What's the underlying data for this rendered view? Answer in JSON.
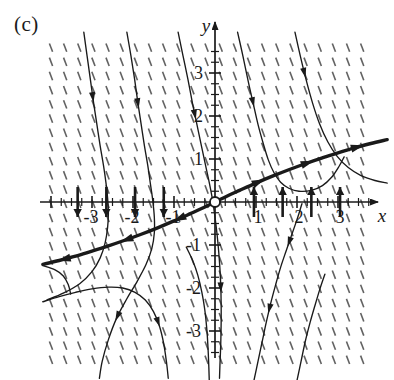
{
  "figure": {
    "panel_label": "(c)",
    "type": "direction-field-with-solution-curves",
    "background_color": "#ffffff",
    "ink_color": "#1a1a1a",
    "field_tick_color": "#555555"
  },
  "axes": {
    "x_axis_label": "x",
    "y_axis_label": "y",
    "origin_px": {
      "x": 215,
      "y": 202
    },
    "unit_px": {
      "x": 41,
      "y": 43
    },
    "x_tick_labels": [
      "-3",
      "-2",
      "-1",
      "1",
      "2",
      "3"
    ],
    "x_tick_values": [
      -3,
      -2,
      -1,
      1,
      2,
      3
    ],
    "y_tick_labels": [
      "3",
      "2",
      "1",
      "-1",
      "-2",
      "-3"
    ],
    "y_tick_values": [
      3,
      2,
      1,
      -1,
      -2,
      -3
    ],
    "xlim": [
      -4.2,
      4.0
    ],
    "ylim": [
      -4.2,
      3.9
    ],
    "minor_ticks_per_unit": 3,
    "axis_arrow_ends": [
      "x-positive",
      "y-positive"
    ],
    "equilibrium_marker": {
      "shape": "open-circle",
      "x": 0,
      "y": 0
    }
  },
  "chart_data": {
    "type": "line",
    "title": "",
    "subtitle": "",
    "xlabel": "x",
    "ylabel": "y",
    "xlim": [
      -4.2,
      4.0
    ],
    "ylim": [
      -4.2,
      3.9
    ],
    "grid": false,
    "legend": "none",
    "annotations": [
      "(c)"
    ],
    "x_ticks": [
      -3,
      -2,
      -1,
      1,
      2,
      3
    ],
    "y_ticks": [
      -3,
      -2,
      -1,
      1,
      2,
      3
    ],
    "direction_field": {
      "description": "short line segments of steep negative slope on a regular lattice",
      "x_start": -4.0,
      "x_end": 3.9,
      "y_start": -4.0,
      "y_end": 3.6,
      "x_step": 0.345,
      "y_step": 0.33,
      "segment_length_px": 9,
      "segment_slope_px": {
        "dx": -3.2,
        "dy": -8.4
      }
    },
    "axis_flow_arrows": {
      "description": "bold vertical arrows on the x-axis showing flow direction",
      "negative_side_direction": "down",
      "positive_side_direction": "up",
      "x_positions": [
        -3.35,
        -2.65,
        -1.95,
        -1.25,
        0.95,
        1.65,
        2.35,
        3.05
      ],
      "length_px": 30
    },
    "separatrix": {
      "name": "bold separatrix through origin",
      "style": "bold",
      "points": [
        [
          -4.2,
          -1.45
        ],
        [
          -3.8,
          -1.36
        ],
        [
          -3.4,
          -1.26
        ],
        [
          -3.0,
          -1.14
        ],
        [
          -2.6,
          -1.02
        ],
        [
          -2.2,
          -0.89
        ],
        [
          -1.8,
          -0.75
        ],
        [
          -1.4,
          -0.6
        ],
        [
          -1.0,
          -0.44
        ],
        [
          -0.6,
          -0.27
        ],
        [
          -0.3,
          -0.14
        ],
        [
          0.0,
          0.0
        ],
        [
          0.3,
          0.14
        ],
        [
          0.6,
          0.27
        ],
        [
          1.0,
          0.44
        ],
        [
          1.4,
          0.6
        ],
        [
          1.8,
          0.75
        ],
        [
          2.2,
          0.89
        ],
        [
          2.6,
          1.02
        ],
        [
          3.0,
          1.14
        ],
        [
          3.4,
          1.26
        ],
        [
          3.8,
          1.36
        ],
        [
          4.2,
          1.45
        ]
      ],
      "arrow_positions": [
        {
          "x": -3.7,
          "dir": "left"
        },
        {
          "x": -2.2,
          "dir": "left"
        },
        {
          "x": -0.9,
          "dir": "left"
        },
        {
          "x": 1.1,
          "dir": "right"
        },
        {
          "x": 2.3,
          "dir": "right"
        },
        {
          "x": 3.5,
          "dir": "right"
        }
      ]
    },
    "solution_curves": [
      {
        "id": "curve-1",
        "region": "upper-left-steep",
        "points": [
          [
            -3.2,
            3.95
          ],
          [
            -3.12,
            3.4
          ],
          [
            -3.04,
            2.85
          ],
          [
            -2.96,
            2.3
          ],
          [
            -2.88,
            1.8
          ],
          [
            -2.8,
            1.3
          ],
          [
            -2.72,
            0.85
          ],
          [
            -2.66,
            0.45
          ],
          [
            -2.62,
            0.1
          ],
          [
            -2.6,
            -0.25
          ],
          [
            -2.62,
            -0.6
          ],
          [
            -2.68,
            -0.95
          ],
          [
            -2.8,
            -1.3
          ],
          [
            -3.0,
            -1.62
          ],
          [
            -3.3,
            -1.9
          ],
          [
            -3.7,
            -2.12
          ],
          [
            -4.1,
            -2.28
          ]
        ],
        "arrows": [
          {
            "t": 0.22,
            "dir": "forward"
          }
        ]
      },
      {
        "id": "curve-2",
        "region": "upper-left-mid",
        "points": [
          [
            -2.15,
            3.95
          ],
          [
            -2.05,
            3.4
          ],
          [
            -1.96,
            2.85
          ],
          [
            -1.88,
            2.3
          ],
          [
            -1.8,
            1.8
          ],
          [
            -1.72,
            1.3
          ],
          [
            -1.64,
            0.85
          ],
          [
            -1.58,
            0.45
          ],
          [
            -1.52,
            0.05
          ],
          [
            -1.48,
            -0.35
          ],
          [
            -1.48,
            -0.72
          ],
          [
            -1.54,
            -1.08
          ],
          [
            -1.68,
            -1.45
          ],
          [
            -1.9,
            -1.85
          ],
          [
            -2.15,
            -2.25
          ],
          [
            -2.4,
            -2.7
          ],
          [
            -2.6,
            -3.2
          ],
          [
            -2.75,
            -3.7
          ],
          [
            -2.82,
            -4.1
          ]
        ],
        "arrows": [
          {
            "t": 0.2,
            "dir": "forward"
          },
          {
            "t": 0.82,
            "dir": "forward"
          }
        ]
      },
      {
        "id": "curve-3",
        "region": "upper-center",
        "points": [
          [
            -0.9,
            3.95
          ],
          [
            -0.78,
            3.4
          ],
          [
            -0.66,
            2.85
          ],
          [
            -0.55,
            2.3
          ],
          [
            -0.44,
            1.8
          ],
          [
            -0.33,
            1.3
          ],
          [
            -0.23,
            0.85
          ],
          [
            -0.14,
            0.45
          ],
          [
            -0.06,
            0.05
          ],
          [
            0.0,
            -0.35
          ],
          [
            0.05,
            -0.75
          ],
          [
            0.09,
            -1.15
          ],
          [
            0.12,
            -1.55
          ],
          [
            0.14,
            -1.95
          ],
          [
            0.15,
            -2.35
          ],
          [
            0.15,
            -2.8
          ],
          [
            0.14,
            -3.3
          ],
          [
            0.12,
            -3.8
          ],
          [
            0.11,
            -4.1
          ]
        ],
        "arrows": [
          {
            "t": 0.24,
            "dir": "forward"
          },
          {
            "t": 0.74,
            "dir": "forward"
          }
        ]
      },
      {
        "id": "curve-4",
        "region": "upper-right-inner",
        "points": [
          [
            0.55,
            3.95
          ],
          [
            0.68,
            3.4
          ],
          [
            0.8,
            2.85
          ],
          [
            0.93,
            2.3
          ],
          [
            1.05,
            1.8
          ],
          [
            1.18,
            1.35
          ],
          [
            1.3,
            0.98
          ],
          [
            1.44,
            0.68
          ],
          [
            1.6,
            0.46
          ],
          [
            1.8,
            0.32
          ],
          [
            2.05,
            0.25
          ],
          [
            2.35,
            0.27
          ],
          [
            2.62,
            0.38
          ],
          [
            2.85,
            0.58
          ],
          [
            3.02,
            0.82
          ],
          [
            3.15,
            1.05
          ]
        ],
        "arrows": [
          {
            "t": 0.3,
            "dir": "forward"
          }
        ]
      },
      {
        "id": "curve-5",
        "region": "right-descending",
        "points": [
          [
            1.95,
            3.95
          ],
          [
            2.08,
            3.4
          ],
          [
            2.22,
            2.85
          ],
          [
            2.38,
            2.3
          ],
          [
            2.55,
            1.82
          ],
          [
            2.75,
            1.4
          ],
          [
            2.98,
            1.06
          ],
          [
            3.25,
            0.8
          ],
          [
            3.55,
            0.62
          ],
          [
            3.9,
            0.5
          ],
          [
            4.2,
            0.44
          ]
        ],
        "arrows": [
          {
            "t": 0.22,
            "dir": "forward"
          }
        ]
      },
      {
        "id": "curve-6",
        "region": "lower-left-of-separatrix",
        "points": [
          [
            -4.2,
            -2.32
          ],
          [
            -3.8,
            -2.2
          ],
          [
            -3.4,
            -2.1
          ],
          [
            -3.0,
            -2.02
          ],
          [
            -2.6,
            -1.98
          ],
          [
            -2.25,
            -2.0
          ],
          [
            -1.95,
            -2.1
          ],
          [
            -1.7,
            -2.28
          ],
          [
            -1.5,
            -2.55
          ],
          [
            -1.35,
            -2.9
          ],
          [
            -1.25,
            -3.3
          ],
          [
            -1.18,
            -3.75
          ],
          [
            -1.14,
            -4.1
          ]
        ],
        "arrows": [
          {
            "t": 0.7,
            "dir": "forward"
          }
        ]
      },
      {
        "id": "curve-7",
        "region": "lower-center",
        "points": [
          [
            -0.7,
            -1.05
          ],
          [
            -0.55,
            -1.35
          ],
          [
            -0.42,
            -1.7
          ],
          [
            -0.32,
            -2.1
          ],
          [
            -0.25,
            -2.5
          ],
          [
            -0.2,
            -2.95
          ],
          [
            -0.17,
            -3.4
          ],
          [
            -0.15,
            -3.85
          ],
          [
            -0.14,
            -4.15
          ]
        ],
        "arrows": []
      },
      {
        "id": "curve-8",
        "region": "lower-right-inner",
        "points": [
          [
            0.95,
            -4.15
          ],
          [
            1.05,
            -3.7
          ],
          [
            1.15,
            -3.25
          ],
          [
            1.25,
            -2.8
          ],
          [
            1.36,
            -2.35
          ],
          [
            1.48,
            -1.92
          ],
          [
            1.6,
            -1.52
          ],
          [
            1.73,
            -1.15
          ],
          [
            1.85,
            -0.82
          ],
          [
            1.96,
            -0.52
          ],
          [
            2.05,
            -0.26
          ],
          [
            2.12,
            -0.04
          ]
        ],
        "arrows": [
          {
            "t": 0.4,
            "dir": "backward"
          },
          {
            "t": 0.78,
            "dir": "backward"
          }
        ]
      },
      {
        "id": "curve-9",
        "region": "bottom-right-far",
        "points": [
          [
            2.0,
            -4.15
          ],
          [
            2.1,
            -3.7
          ],
          [
            2.2,
            -3.25
          ],
          [
            2.32,
            -2.8
          ],
          [
            2.44,
            -2.4
          ],
          [
            2.56,
            -2.02
          ],
          [
            2.68,
            -1.68
          ]
        ],
        "arrows": []
      },
      {
        "id": "curve-10",
        "region": "far-left-lower-tail",
        "points": [
          [
            -4.2,
            -1.48
          ],
          [
            -3.9,
            -1.58
          ],
          [
            -3.7,
            -1.72
          ],
          [
            -3.58,
            -1.92
          ],
          [
            -3.52,
            -2.14
          ]
        ],
        "arrows": []
      }
    ]
  }
}
